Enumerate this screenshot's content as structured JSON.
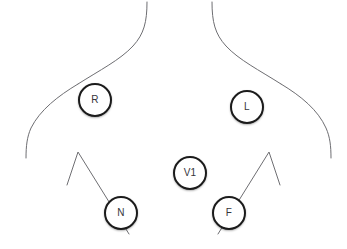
{
  "diagram": {
    "type": "ecg-electrode-placement",
    "title": "",
    "background_color": "#ffffff",
    "outline_color": "#6e6e72",
    "electrode_border_color": "#1b1b1b",
    "electrode_fill_color": "#ffffff",
    "electrode_label_color": "#35353a",
    "electrodes": [
      {
        "id": "R",
        "label": "R",
        "x": 95,
        "y": 100,
        "radius": 17
      },
      {
        "id": "L",
        "label": "L",
        "x": 247,
        "y": 107,
        "radius": 17
      },
      {
        "id": "V1",
        "label": "V1",
        "x": 190,
        "y": 173,
        "radius": 17
      },
      {
        "id": "N",
        "label": "N",
        "x": 121,
        "y": 213,
        "radius": 17
      },
      {
        "id": "F",
        "label": "F",
        "x": 229,
        "y": 213,
        "radius": 17
      }
    ],
    "outline_paths": {
      "neck_left": "M147,2 C147,22 144,34 133,46 C120,60 100,70 78,84",
      "shoulder_left": "M78,84 C58,96 40,110 31,128 C27,137 26,146 26,158",
      "neck_right": "M212,2 C212,22 215,34 226,46 C239,60 259,70 281,84",
      "shoulder_right": "M281,84 C301,96 318,110 326,128 C330,137 331,146 331,158",
      "costal_left": "M67,185 L78,152 L129,234",
      "costal_right": "M280,185 L269,152 L218,234"
    }
  }
}
